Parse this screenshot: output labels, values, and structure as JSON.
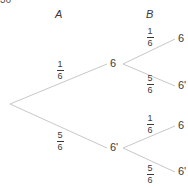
{
  "page_number": "36",
  "headers": {
    "a": "A",
    "b": "B"
  },
  "nodes": {
    "a_top": "6",
    "a_bottom": "6'",
    "b_1": "6",
    "b_2": "6'",
    "b_3": "6",
    "b_4": "6'"
  },
  "probabilities": {
    "root_to_a_top": {
      "num": "1",
      "den": "6"
    },
    "root_to_a_bottom": {
      "num": "5",
      "den": "6"
    },
    "a_top_to_b_1": {
      "num": "1",
      "den": "6"
    },
    "a_top_to_b_2": {
      "num": "5",
      "den": "6"
    },
    "a_bottom_to_b_3": {
      "num": "1",
      "den": "6"
    },
    "a_bottom_to_b_4": {
      "num": "5",
      "den": "6"
    }
  },
  "colors": {
    "line": "#c8c8c8",
    "text": "#3a3a3a"
  }
}
